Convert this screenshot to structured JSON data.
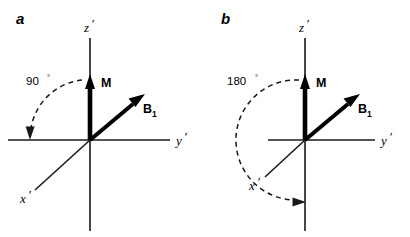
{
  "figure": {
    "background_color": "#ffffff",
    "stroke_color": "#1a1a1a",
    "vector_color": "#000000",
    "panel_count": 2
  },
  "panels": [
    {
      "letter": "a",
      "angle_value": "90",
      "degree_symbol": "°",
      "axes": [
        {
          "name": "z-prime",
          "label": "z",
          "prime": "′"
        },
        {
          "name": "y-prime",
          "label": "y",
          "prime": "′"
        },
        {
          "name": "x-prime",
          "label": "x",
          "prime": "′"
        }
      ],
      "vectors": [
        {
          "name": "magnetization",
          "label": "M",
          "subscript": ""
        },
        {
          "name": "b1-field",
          "label": "B",
          "subscript": "1"
        }
      ],
      "arc": {
        "name": "rotation-arc-90",
        "sweep_degrees": 90,
        "direction": "clockwise-from-z-to-negative-y",
        "style": "dashed",
        "arrowhead": "end"
      }
    },
    {
      "letter": "b",
      "angle_value": "180",
      "degree_symbol": "°",
      "axes": [
        {
          "name": "z-prime",
          "label": "z",
          "prime": "′"
        },
        {
          "name": "y-prime",
          "label": "y",
          "prime": "′"
        },
        {
          "name": "x-prime",
          "label": "x",
          "prime": "′"
        }
      ],
      "vectors": [
        {
          "name": "magnetization",
          "label": "M",
          "subscript": ""
        },
        {
          "name": "b1-field",
          "label": "B",
          "subscript": "1"
        }
      ],
      "arc": {
        "name": "rotation-arc-180",
        "sweep_degrees": 180,
        "direction": "clockwise-from-z-to-negative-z",
        "style": "dashed",
        "arrowhead": "end"
      }
    }
  ]
}
